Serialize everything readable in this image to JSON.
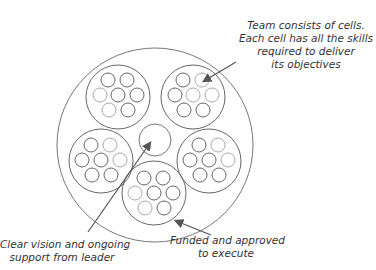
{
  "labels": {
    "cells": [
      "Team consists of cells.",
      "Each cell has all the skills",
      "required to deliver",
      "its objectives"
    ],
    "leader": [
      "Clear vision and ongoing",
      "support from leader"
    ],
    "funded": [
      "Funded and approved",
      "to execute"
    ]
  },
  "colors": {
    "stroke": "#555555",
    "light_stroke": "#aaaaaa",
    "text": "#333333"
  }
}
